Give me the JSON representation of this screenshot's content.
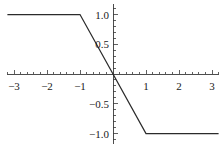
{
  "chart_data": {
    "type": "line",
    "title": "",
    "subtitle": "",
    "xlabel": "",
    "ylabel": "",
    "xlim": [
      -3.2,
      3.2
    ],
    "ylim": [
      -1.18,
      1.18
    ],
    "grid": false,
    "legend": "none",
    "axis_style": "centered-cross",
    "line_color": "#2b2b2b",
    "axis_color": "#3a3a3a",
    "background_color": "#ffffff",
    "x_ticks": [
      {
        "value": -3,
        "label": "-3"
      },
      {
        "value": -2,
        "label": "-2"
      },
      {
        "value": -1,
        "label": "-1"
      },
      {
        "value": 1,
        "label": "1"
      },
      {
        "value": 2,
        "label": "2"
      },
      {
        "value": 3,
        "label": "3"
      }
    ],
    "y_ticks": [
      {
        "value": 1.0,
        "label": "1.0"
      },
      {
        "value": 0.5,
        "label": "0.5"
      },
      {
        "value": -0.5,
        "label": "-0.5"
      },
      {
        "value": -1.0,
        "label": "-1.0"
      }
    ],
    "x_minor_tick_step": 0.2,
    "y_minor_tick_step": 0.1,
    "series": [
      {
        "name": "clamp",
        "x": [
          -3.2,
          -1.0,
          0.0,
          1.0,
          3.2
        ],
        "values": [
          1.0,
          1.0,
          0.0,
          -1.0,
          -1.0
        ]
      }
    ],
    "breakpoints": [
      {
        "x": -1.0,
        "y": 1.0
      },
      {
        "x": 1.0,
        "y": -1.0
      }
    ]
  }
}
